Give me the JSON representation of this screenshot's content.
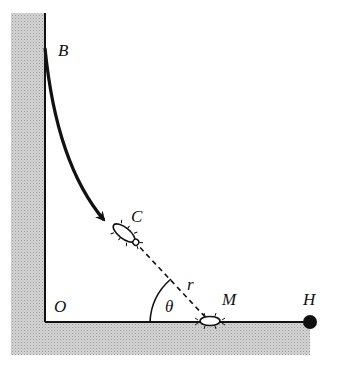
{
  "diagram": {
    "labels": {
      "B": "B",
      "C": "C",
      "O": "O",
      "M": "M",
      "H": "H",
      "r": "r",
      "theta": "θ"
    },
    "colors": {
      "hatch": "#c8c8c8",
      "line": "#111111",
      "background": "#ffffff"
    },
    "elements": [
      "vertical wall (shaded)",
      "horizontal floor (shaded)",
      "curved arrow from B toward C",
      "bug at C",
      "dashed line C to M",
      "bug at M",
      "angle theta at floor",
      "point H"
    ]
  }
}
